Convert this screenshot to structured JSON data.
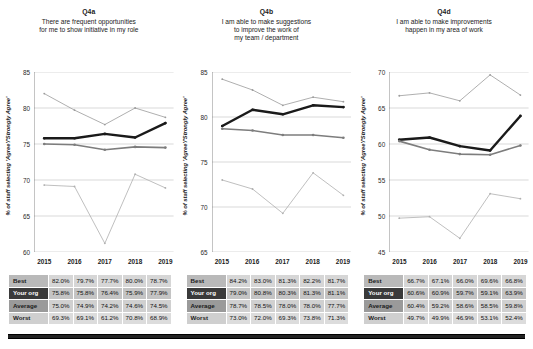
{
  "axis": {
    "ylabel": "% of staff selecting 'Agree'/'Strongly Agree'",
    "years": [
      "2015",
      "2016",
      "2017",
      "2018",
      "2019"
    ]
  },
  "series_names": [
    "Best",
    "Your org",
    "Average",
    "Worst"
  ],
  "series_colors": {
    "best": "#9c9c9c",
    "your_org": "#1a1a1a",
    "average": "#7d7d7d",
    "worst": "#b0b0b0"
  },
  "panels": [
    {
      "code": "Q4a",
      "question": "There are frequent opportunities\nfor me to show initiative in my role",
      "chart_data": {
        "type": "line",
        "title": "Q4a",
        "xlabel": "",
        "ylabel": "% of staff selecting 'Agree'/'Strongly Agree'",
        "categories": [
          "2015",
          "2016",
          "2017",
          "2018",
          "2019"
        ],
        "ylim": [
          60,
          85
        ],
        "yticks": [
          60,
          65,
          70,
          75,
          80,
          85
        ],
        "grid": true,
        "legend": "none",
        "series": [
          {
            "name": "Best",
            "values": [
              82.0,
              79.7,
              77.7,
              80.0,
              78.7
            ]
          },
          {
            "name": "Your org",
            "values": [
              75.8,
              75.8,
              76.4,
              75.9,
              77.9
            ]
          },
          {
            "name": "Average",
            "values": [
              75.0,
              74.9,
              74.2,
              74.6,
              74.5
            ]
          },
          {
            "name": "Worst",
            "values": [
              69.3,
              69.1,
              61.2,
              70.8,
              68.9
            ]
          }
        ]
      },
      "table": {
        "rows": [
          {
            "label": "Best",
            "values": [
              "82.0%",
              "79.7%",
              "77.7%",
              "80.0%",
              "78.7%"
            ]
          },
          {
            "label": "Your org",
            "values": [
              "75.8%",
              "75.8%",
              "76.4%",
              "75.9%",
              "77.9%"
            ]
          },
          {
            "label": "Average",
            "values": [
              "75.0%",
              "74.9%",
              "74.2%",
              "74.6%",
              "74.5%"
            ]
          },
          {
            "label": "Worst",
            "values": [
              "69.3%",
              "69.1%",
              "61.2%",
              "70.8%",
              "68.9%"
            ]
          }
        ]
      }
    },
    {
      "code": "Q4b",
      "question": "I am able to make suggestions\nto improve the work of\nmy team / department",
      "chart_data": {
        "type": "line",
        "title": "Q4b",
        "xlabel": "",
        "ylabel": "% of staff selecting 'Agree'/'Strongly Agree'",
        "categories": [
          "2015",
          "2016",
          "2017",
          "2018",
          "2019"
        ],
        "ylim": [
          65,
          85
        ],
        "yticks": [
          65,
          70,
          75,
          80,
          85
        ],
        "grid": true,
        "legend": "none",
        "series": [
          {
            "name": "Best",
            "values": [
              84.2,
              83.0,
              81.3,
              82.2,
              81.7
            ]
          },
          {
            "name": "Your org",
            "values": [
              79.0,
              80.8,
              80.3,
              81.3,
              81.1
            ]
          },
          {
            "name": "Average",
            "values": [
              78.7,
              78.5,
              78.0,
              78.0,
              77.7
            ]
          },
          {
            "name": "Worst",
            "values": [
              73.0,
              72.0,
              69.3,
              73.8,
              71.3
            ]
          }
        ]
      },
      "table": {
        "rows": [
          {
            "label": "Best",
            "values": [
              "84.2%",
              "83.0%",
              "81.3%",
              "82.2%",
              "81.7%"
            ]
          },
          {
            "label": "Your org",
            "values": [
              "79.0%",
              "80.8%",
              "80.3%",
              "81.3%",
              "81.1%"
            ]
          },
          {
            "label": "Average",
            "values": [
              "78.7%",
              "78.5%",
              "78.0%",
              "78.0%",
              "77.7%"
            ]
          },
          {
            "label": "Worst",
            "values": [
              "73.0%",
              "72.0%",
              "69.3%",
              "73.8%",
              "71.3%"
            ]
          }
        ]
      }
    },
    {
      "code": "Q4d",
      "question": "I am able to make improvements\nhappen in my area of work",
      "chart_data": {
        "type": "line",
        "title": "Q4d",
        "xlabel": "",
        "ylabel": "% of staff selecting 'Agree'/'Strongly Agree'",
        "categories": [
          "2015",
          "2016",
          "2017",
          "2018",
          "2019"
        ],
        "ylim": [
          45,
          70
        ],
        "yticks": [
          45,
          50,
          55,
          60,
          65,
          70
        ],
        "grid": true,
        "legend": "none",
        "series": [
          {
            "name": "Best",
            "values": [
              66.7,
              67.1,
              66.0,
              69.6,
              66.8
            ]
          },
          {
            "name": "Your org",
            "values": [
              60.6,
              60.9,
              59.7,
              59.1,
              63.9
            ]
          },
          {
            "name": "Average",
            "values": [
              60.4,
              59.2,
              58.6,
              58.5,
              59.8
            ]
          },
          {
            "name": "Worst",
            "values": [
              49.7,
              49.9,
              46.9,
              53.1,
              52.4
            ]
          }
        ]
      },
      "table": {
        "rows": [
          {
            "label": "Best",
            "values": [
              "66.7%",
              "67.1%",
              "66.0%",
              "69.6%",
              "66.8%"
            ]
          },
          {
            "label": "Your org",
            "values": [
              "60.6%",
              "60.9%",
              "59.7%",
              "59.1%",
              "63.9%"
            ]
          },
          {
            "label": "Average",
            "values": [
              "60.4%",
              "59.2%",
              "58.6%",
              "58.5%",
              "59.8%"
            ]
          },
          {
            "label": "Worst",
            "values": [
              "49.7%",
              "49.9%",
              "46.9%",
              "53.1%",
              "52.4%"
            ]
          }
        ]
      }
    }
  ]
}
